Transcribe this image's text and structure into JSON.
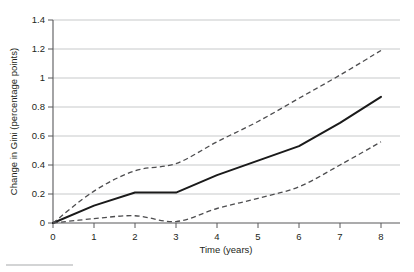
{
  "chart_data": {
    "type": "line",
    "title": "",
    "subtitle": "",
    "xlabel": "Time (years)",
    "ylabel": "Change in Gini (percentage points)",
    "xlim": [
      0,
      8
    ],
    "ylim": [
      0,
      1.4
    ],
    "xticks": [
      "0",
      "1",
      "2",
      "3",
      "4",
      "5",
      "6",
      "7",
      "8"
    ],
    "yticks": [
      "0",
      "0.2",
      "0.4",
      "0.6",
      "0.8",
      "1",
      "1.2",
      "1.4"
    ],
    "xtick_values": [
      0,
      1,
      2,
      3,
      4,
      5,
      6,
      7,
      8
    ],
    "ytick_values": [
      0,
      0.2,
      0.4,
      0.6,
      0.8,
      1.0,
      1.2,
      1.4
    ],
    "grid": "horizontal",
    "legend": "none",
    "x": [
      0,
      1,
      2,
      3,
      4,
      5,
      6,
      7,
      8
    ],
    "series": [
      {
        "name": "Point estimate",
        "style": "solid",
        "color": "#1a1a1a",
        "values": [
          0.0,
          0.12,
          0.21,
          0.21,
          0.33,
          0.43,
          0.53,
          0.69,
          0.87
        ]
      },
      {
        "name": "Upper confidence bound",
        "style": "dashed",
        "color": "#4d4d4f",
        "values": [
          0.0,
          0.22,
          0.36,
          0.41,
          0.56,
          0.7,
          0.86,
          1.02,
          1.19
        ]
      },
      {
        "name": "Lower confidence bound",
        "style": "dashed",
        "color": "#4d4d4f",
        "values": [
          0.0,
          0.03,
          0.05,
          0.01,
          0.1,
          0.17,
          0.25,
          0.4,
          0.56
        ]
      }
    ]
  },
  "figure": {
    "footnote_rule_present": true
  }
}
